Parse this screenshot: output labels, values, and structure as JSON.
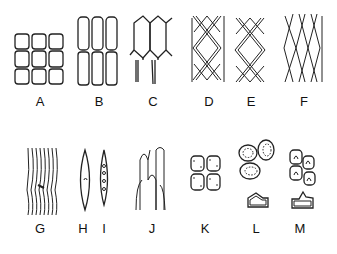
{
  "figure": {
    "type": "cell-types-diagram",
    "panels": [
      {
        "label": "A",
        "x": 40,
        "y": 102
      },
      {
        "label": "B",
        "x": 99,
        "y": 102
      },
      {
        "label": "C",
        "x": 153,
        "y": 102
      },
      {
        "label": "D",
        "x": 209,
        "y": 102
      },
      {
        "label": "E",
        "x": 251,
        "y": 102
      },
      {
        "label": "F",
        "x": 304,
        "y": 102
      },
      {
        "label": "G",
        "x": 40,
        "y": 229
      },
      {
        "label": "H",
        "x": 83,
        "y": 229
      },
      {
        "label": "I",
        "x": 104,
        "y": 229
      },
      {
        "label": "J",
        "x": 152,
        "y": 229
      },
      {
        "label": "K",
        "x": 205,
        "y": 229
      },
      {
        "label": "L",
        "x": 256,
        "y": 229
      },
      {
        "label": "M",
        "x": 300,
        "y": 229
      }
    ]
  }
}
